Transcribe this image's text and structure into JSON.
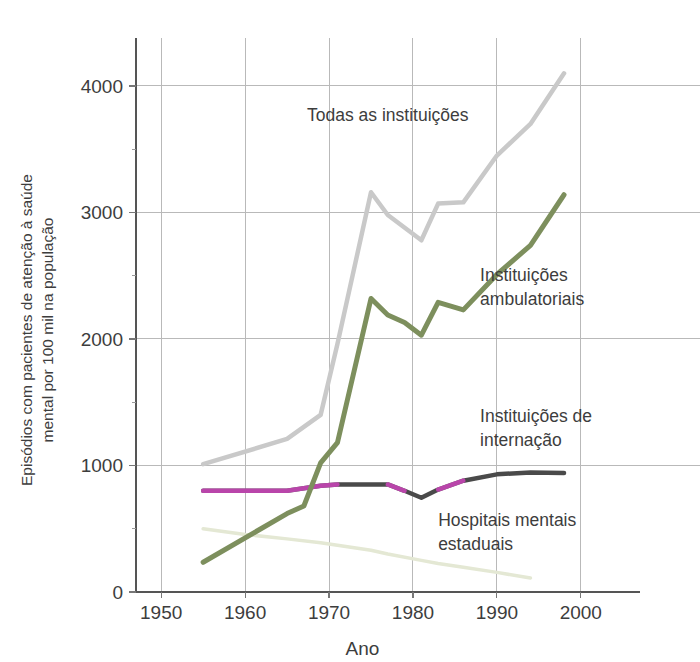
{
  "chart_data": {
    "type": "line",
    "title": "",
    "subtitle": "",
    "xlabel": "Ano",
    "ylabel": "Episódios com pacientes de atenção à saúde mental por 100 mil na população",
    "ylabel_lines": [
      "Episódios com pacientes de atenção à saúde",
      "mental por 100 mil na população"
    ],
    "xlim": [
      1947,
      2003
    ],
    "ylim": [
      0,
      4300
    ],
    "xticks": [
      1950,
      1960,
      1970,
      1980,
      1990,
      2000
    ],
    "xtick_labels": [
      "1950",
      "1960",
      "1970",
      "1980",
      "1990",
      "2000"
    ],
    "yticks": [
      0,
      1000,
      2000,
      3000,
      4000
    ],
    "ytick_labels": [
      "0",
      "1000",
      "2000",
      "3000",
      "4000"
    ],
    "yticks_minor": [
      500,
      1500,
      2500,
      3500
    ],
    "grid": true,
    "grid_axes": "both",
    "legend": "inline-annotations",
    "series": [
      {
        "name": "Todas as instituições",
        "label": "Todas as instituições",
        "color": "#c9c9c9",
        "width": 4.5,
        "label_x": 1977,
        "label_y": 3720,
        "label_anchor": "middle",
        "x": [
          1955,
          1965,
          1969,
          1971,
          1975,
          1977,
          1981,
          1983,
          1986,
          1990,
          1994,
          1998
        ],
        "y": [
          1010,
          1210,
          1400,
          1960,
          3160,
          2980,
          2780,
          3070,
          3080,
          3450,
          3700,
          4100
        ]
      },
      {
        "name": "Instituições ambulatoriais",
        "label": "Instituições ambulatoriais",
        "color": "#7d8f5d",
        "width": 5,
        "label_x": 1988,
        "label_y": 2460,
        "label_anchor": "start",
        "label_lines": [
          "Instituições",
          "ambulatoriais"
        ],
        "x": [
          1955,
          1965,
          1967,
          1969,
          1971,
          1975,
          1977,
          1979,
          1981,
          1983,
          1986,
          1990,
          1994,
          1998
        ],
        "y": [
          235,
          620,
          680,
          1020,
          1180,
          2320,
          2190,
          2130,
          2030,
          2290,
          2230,
          2510,
          2740,
          3140
        ]
      },
      {
        "name": "Instituições de internação",
        "label": "Instituições de internação",
        "color": "#4a4a4a",
        "width": 4.5,
        "label_x": 1988,
        "label_y": 1340,
        "label_anchor": "start",
        "label_lines": [
          "Instituições de",
          "internação"
        ],
        "x": [
          1955,
          1965,
          1969,
          1971,
          1975,
          1977,
          1979,
          1981,
          1983,
          1986,
          1990,
          1994,
          1998
        ],
        "y": [
          800,
          800,
          840,
          850,
          850,
          850,
          800,
          745,
          810,
          880,
          930,
          945,
          940
        ],
        "highlight_color": "#cc44bb",
        "highlight_segments": [
          [
            1955,
            1971
          ],
          [
            1977,
            1979
          ],
          [
            1983,
            1986
          ]
        ]
      },
      {
        "name": "Hospitais mentais estaduais",
        "label": "Hospitais mentais estaduais",
        "color": "#e4e8d4",
        "width": 3.5,
        "label_x": 1983,
        "label_y": 520,
        "label_anchor": "start",
        "label_lines": [
          "Hospitais mentais",
          "estaduais"
        ],
        "x": [
          1955,
          1960,
          1965,
          1969,
          1971,
          1975,
          1977,
          1981,
          1983,
          1986,
          1990,
          1994
        ],
        "y": [
          500,
          455,
          420,
          390,
          370,
          330,
          300,
          250,
          225,
          195,
          155,
          110
        ]
      }
    ]
  }
}
